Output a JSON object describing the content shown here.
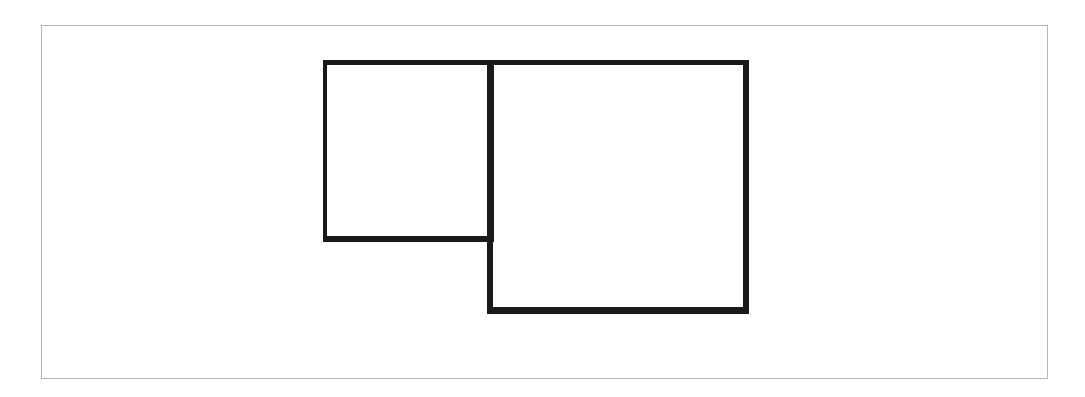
{
  "diagram": {
    "frame": {
      "border_color": "#b5b5b5",
      "background": "#ffffff"
    },
    "shapes": [
      {
        "id": "small-square",
        "type": "rectangle",
        "stroke": "#1a1a1a",
        "fill": "none"
      },
      {
        "id": "large-square",
        "type": "rectangle",
        "stroke": "#1a1a1a",
        "fill": "none"
      }
    ]
  }
}
